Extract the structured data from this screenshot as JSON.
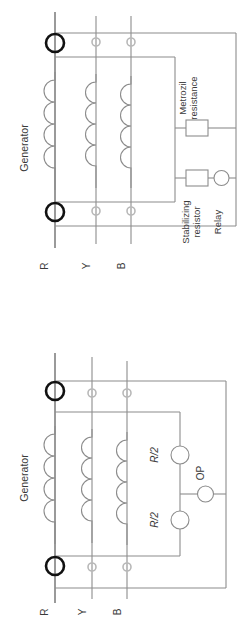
{
  "page": {
    "orientation": "rotated-90",
    "figure_count": 2,
    "background_color": "#ffffff",
    "line_color": "#8c8c8c",
    "bold_line_color": "#111111",
    "text_color": "#3a3a3a"
  },
  "figure_top": {
    "name": "generator-differential-protection-with-stabilizing-resistor",
    "generator_label": "Generator",
    "phase_labels": [
      "R",
      "Y",
      "B"
    ],
    "components": [
      {
        "id": "metrosil",
        "label_line1": "Metrozil",
        "label_line2": "resistance",
        "type": "resistor-box"
      },
      {
        "id": "stabilizing",
        "label_line1": "Stabilizing",
        "label_line2": "resistor",
        "type": "resistor-box"
      },
      {
        "id": "relay",
        "label_line1": "Relay",
        "type": "circle"
      }
    ],
    "ct_count": 6,
    "winding_count": 3,
    "winding_bumps": 4
  },
  "figure_bottom": {
    "name": "generator-differential-protection-with-split-resistors",
    "generator_label": "Generator",
    "phase_labels": [
      "R",
      "Y",
      "B"
    ],
    "components": [
      {
        "id": "resistor-upper",
        "label": "R/2",
        "type": "circle"
      },
      {
        "id": "resistor-lower",
        "label": "R/2",
        "type": "circle"
      },
      {
        "id": "op-relay",
        "label": "OP",
        "type": "circle"
      }
    ],
    "ct_count": 6,
    "winding_count": 3,
    "winding_bumps": 4
  }
}
